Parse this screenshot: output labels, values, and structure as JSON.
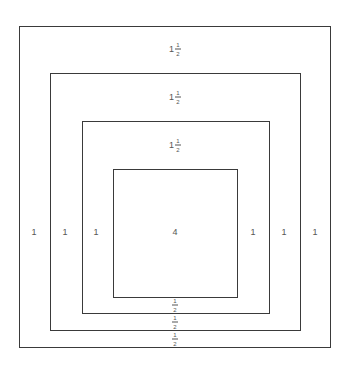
{
  "diagram": {
    "type": "nested-squares",
    "line_color": "#3a3a3a",
    "text_color": "#555555",
    "boxes": [
      {
        "name": "outer-square",
        "left": 19,
        "top": 26,
        "right": 331,
        "bottom": 348
      },
      {
        "name": "second-square",
        "left": 50,
        "top": 73,
        "right": 301,
        "bottom": 331
      },
      {
        "name": "third-square",
        "left": 82,
        "top": 121,
        "right": 270,
        "bottom": 314
      },
      {
        "name": "inner-square",
        "left": 113,
        "top": 169,
        "right": 238,
        "bottom": 298
      }
    ],
    "top_labels": [
      {
        "whole": "1",
        "num": "1",
        "den": "2"
      },
      {
        "whole": "1",
        "num": "1",
        "den": "2"
      },
      {
        "whole": "1",
        "num": "1",
        "den": "2"
      }
    ],
    "bottom_labels": [
      {
        "num": "1",
        "den": "2"
      },
      {
        "num": "1",
        "den": "2"
      },
      {
        "num": "1",
        "den": "2"
      }
    ],
    "left_labels": [
      "1",
      "1",
      "1"
    ],
    "right_labels": [
      "1",
      "1",
      "1"
    ],
    "center_label": "4"
  }
}
